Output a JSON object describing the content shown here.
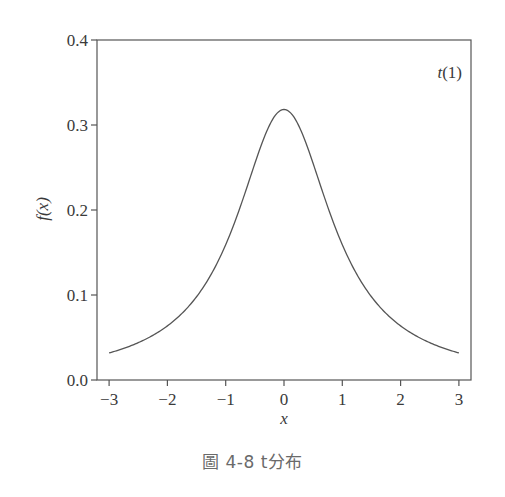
{
  "caption": "圖 4-8  t分布",
  "chart_data": {
    "type": "line",
    "title": "",
    "annotation": "t(1)",
    "xlabel": "x",
    "ylabel": "f(x)",
    "xlim": [
      -3.2,
      3.2
    ],
    "ylim": [
      0.0,
      0.4
    ],
    "xticks": [
      -3,
      -2,
      -1,
      0,
      1,
      2,
      3
    ],
    "xtick_labels": [
      "−3",
      "−2",
      "−1",
      "0",
      "1",
      "2",
      "3"
    ],
    "yticks": [
      0.0,
      0.1,
      0.2,
      0.3,
      0.4
    ],
    "ytick_labels": [
      "0.0",
      "0.1",
      "0.2",
      "0.3",
      "0.4"
    ],
    "grid": false,
    "legend": "none",
    "series": [
      {
        "name": "t(1)",
        "x": [
          -3.0,
          -2.5,
          -2.0,
          -1.5,
          -1.0,
          -0.75,
          -0.5,
          -0.25,
          0.0,
          0.25,
          0.5,
          0.75,
          1.0,
          1.5,
          2.0,
          2.5,
          3.0
        ],
        "values": [
          0.032,
          0.044,
          0.064,
          0.098,
          0.159,
          0.204,
          0.255,
          0.3,
          0.318,
          0.3,
          0.255,
          0.204,
          0.159,
          0.098,
          0.064,
          0.044,
          0.032
        ]
      }
    ]
  }
}
